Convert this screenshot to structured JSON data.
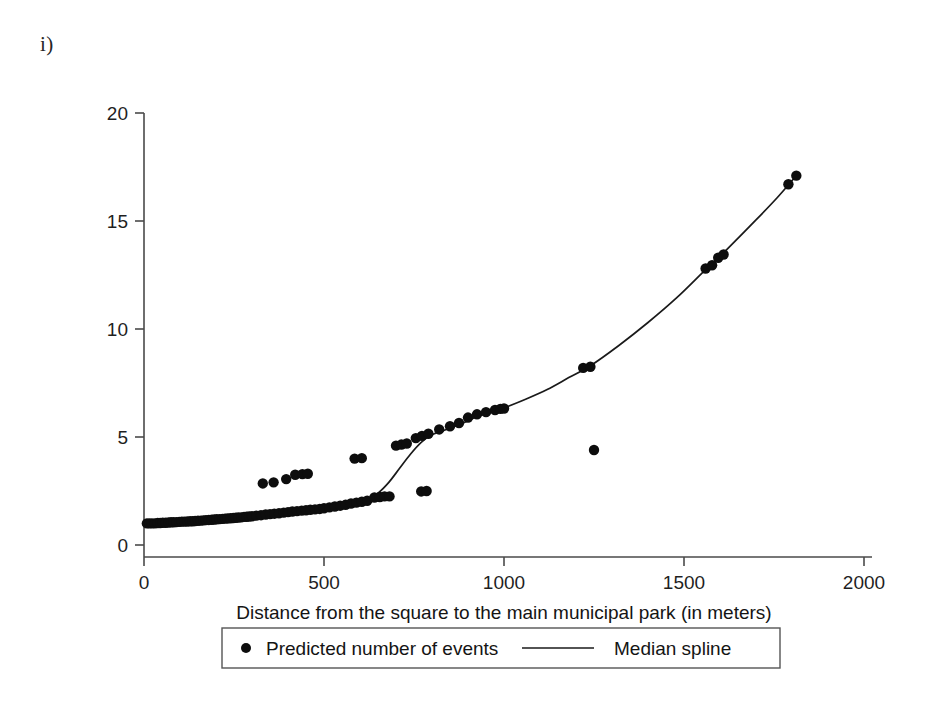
{
  "figure": {
    "panel_label": "i)",
    "background": "#ffffff",
    "ink_color": "#111111"
  },
  "chart_data": {
    "type": "scatter",
    "title": "",
    "subtitle": "",
    "xlabel": "Distance from the square to the main municipal park (in meters)",
    "ylabel": "",
    "xlim": [
      0,
      2000
    ],
    "ylim": [
      0,
      20
    ],
    "xticks": [
      0,
      500,
      1000,
      1500,
      2000
    ],
    "yticks": [
      0,
      5,
      10,
      15,
      20
    ],
    "xticklabels": [
      "0",
      "500",
      "1000",
      "1500",
      "2000"
    ],
    "yticklabels": [
      "0",
      "5",
      "10",
      "15",
      "20"
    ],
    "grid": false,
    "legend_position": "below-axis",
    "legend": [
      {
        "label": "Predicted number of events",
        "marker": "dot",
        "color": "#0d0d0d"
      },
      {
        "label": "Median spline",
        "marker": "line",
        "color": "#1a1a1a"
      }
    ],
    "series": [
      {
        "name": "Predicted number of events",
        "type": "scatter",
        "marker": "dot",
        "color": "#0d0d0d",
        "points": [
          [
            8,
            1.0
          ],
          [
            15,
            1.0
          ],
          [
            22,
            1.0
          ],
          [
            30,
            1.0
          ],
          [
            38,
            1.02
          ],
          [
            45,
            1.02
          ],
          [
            52,
            1.03
          ],
          [
            60,
            1.03
          ],
          [
            68,
            1.04
          ],
          [
            75,
            1.05
          ],
          [
            82,
            1.05
          ],
          [
            90,
            1.06
          ],
          [
            98,
            1.07
          ],
          [
            105,
            1.08
          ],
          [
            112,
            1.08
          ],
          [
            120,
            1.09
          ],
          [
            128,
            1.1
          ],
          [
            135,
            1.1
          ],
          [
            142,
            1.11
          ],
          [
            150,
            1.12
          ],
          [
            158,
            1.13
          ],
          [
            165,
            1.14
          ],
          [
            172,
            1.15
          ],
          [
            180,
            1.16
          ],
          [
            188,
            1.17
          ],
          [
            195,
            1.18
          ],
          [
            202,
            1.19
          ],
          [
            210,
            1.2
          ],
          [
            218,
            1.21
          ],
          [
            225,
            1.22
          ],
          [
            232,
            1.23
          ],
          [
            240,
            1.24
          ],
          [
            248,
            1.25
          ],
          [
            255,
            1.26
          ],
          [
            262,
            1.27
          ],
          [
            270,
            1.28
          ],
          [
            278,
            1.3
          ],
          [
            285,
            1.31
          ],
          [
            292,
            1.32
          ],
          [
            300,
            1.33
          ],
          [
            312,
            1.36
          ],
          [
            325,
            1.38
          ],
          [
            338,
            1.41
          ],
          [
            350,
            1.43
          ],
          [
            362,
            1.45
          ],
          [
            375,
            1.47
          ],
          [
            388,
            1.5
          ],
          [
            400,
            1.52
          ],
          [
            412,
            1.55
          ],
          [
            425,
            1.57
          ],
          [
            438,
            1.59
          ],
          [
            450,
            1.61
          ],
          [
            462,
            1.63
          ],
          [
            475,
            1.65
          ],
          [
            488,
            1.67
          ],
          [
            500,
            1.7
          ],
          [
            515,
            1.74
          ],
          [
            530,
            1.78
          ],
          [
            545,
            1.82
          ],
          [
            560,
            1.86
          ],
          [
            575,
            1.92
          ],
          [
            590,
            1.96
          ],
          [
            605,
            2.0
          ],
          [
            620,
            2.05
          ],
          [
            330,
            2.85
          ],
          [
            360,
            2.9
          ],
          [
            395,
            3.05
          ],
          [
            420,
            3.25
          ],
          [
            440,
            3.28
          ],
          [
            455,
            3.3
          ],
          [
            585,
            4.0
          ],
          [
            605,
            4.02
          ],
          [
            640,
            2.2
          ],
          [
            655,
            2.22
          ],
          [
            668,
            2.25
          ],
          [
            682,
            2.25
          ],
          [
            770,
            2.48
          ],
          [
            785,
            2.5
          ],
          [
            700,
            4.6
          ],
          [
            715,
            4.65
          ],
          [
            730,
            4.7
          ],
          [
            755,
            4.95
          ],
          [
            772,
            5.05
          ],
          [
            790,
            5.15
          ],
          [
            820,
            5.35
          ],
          [
            850,
            5.5
          ],
          [
            875,
            5.65
          ],
          [
            900,
            5.9
          ],
          [
            925,
            6.05
          ],
          [
            950,
            6.15
          ],
          [
            975,
            6.25
          ],
          [
            990,
            6.3
          ],
          [
            1000,
            6.32
          ],
          [
            1220,
            8.2
          ],
          [
            1240,
            8.25
          ],
          [
            1250,
            4.4
          ],
          [
            1560,
            12.8
          ],
          [
            1578,
            12.95
          ],
          [
            1595,
            13.3
          ],
          [
            1610,
            13.45
          ],
          [
            1790,
            16.7
          ],
          [
            1812,
            17.1
          ]
        ]
      },
      {
        "name": "Median spline",
        "type": "line",
        "color": "#1a1a1a",
        "points": [
          [
            10,
            1.0
          ],
          [
            60,
            1.05
          ],
          [
            120,
            1.1
          ],
          [
            180,
            1.17
          ],
          [
            240,
            1.25
          ],
          [
            300,
            1.34
          ],
          [
            360,
            1.44
          ],
          [
            420,
            1.55
          ],
          [
            480,
            1.66
          ],
          [
            540,
            1.8
          ],
          [
            580,
            1.92
          ],
          [
            620,
            2.1
          ],
          [
            650,
            2.4
          ],
          [
            680,
            2.9
          ],
          [
            710,
            3.55
          ],
          [
            740,
            4.2
          ],
          [
            770,
            4.75
          ],
          [
            800,
            5.1
          ],
          [
            840,
            5.35
          ],
          [
            880,
            5.6
          ],
          [
            920,
            5.9
          ],
          [
            960,
            6.15
          ],
          [
            1000,
            6.35
          ],
          [
            1060,
            6.75
          ],
          [
            1120,
            7.2
          ],
          [
            1180,
            7.75
          ],
          [
            1240,
            8.3
          ],
          [
            1320,
            9.25
          ],
          [
            1400,
            10.3
          ],
          [
            1480,
            11.45
          ],
          [
            1560,
            12.75
          ],
          [
            1620,
            13.7
          ],
          [
            1700,
            15.05
          ],
          [
            1760,
            16.1
          ],
          [
            1812,
            17.1
          ]
        ]
      }
    ]
  }
}
